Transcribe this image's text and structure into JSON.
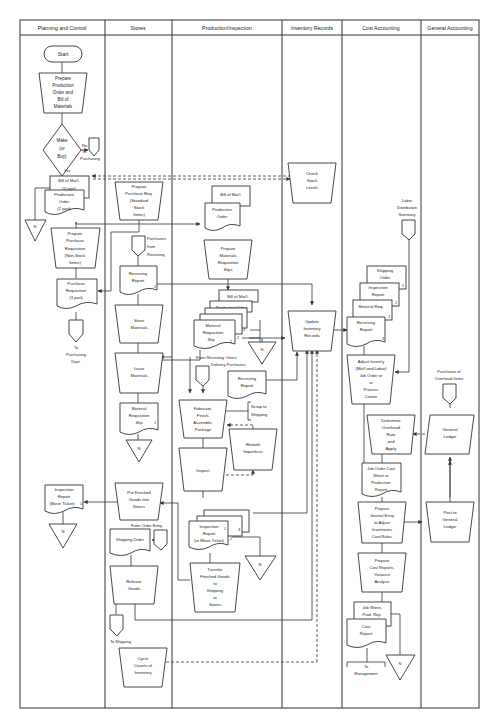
{
  "lanes": [
    {
      "label": "Planning and Control",
      "x1": 20,
      "x2": 105
    },
    {
      "label": "Stores",
      "x1": 105,
      "x2": 172
    },
    {
      "label": "Production/Inspection",
      "x1": 172,
      "x2": 282
    },
    {
      "label": "Inventory Records",
      "x1": 282,
      "x2": 342
    },
    {
      "label": "Cost Accounting",
      "x1": 342,
      "x2": 421
    },
    {
      "label": "General Accounting",
      "x1": 421,
      "x2": 479
    }
  ],
  "nodes": {
    "start": {
      "type": "terminal",
      "lines": [
        "Start"
      ]
    },
    "prepare_prod_order": {
      "type": "manual",
      "lines": [
        "Prepare",
        "Production",
        "Order and",
        "Bill of",
        "Materials"
      ]
    },
    "make_or_buy": {
      "type": "decision",
      "lines": [
        "Make",
        "(or",
        "Buy)"
      ]
    },
    "no_label": "No",
    "yes_label": "Yes",
    "to_purchasing_label": [
      "To",
      "Purchasing"
    ],
    "bom_2part": {
      "type": "document",
      "lines": [
        "Bill of Mat'l.",
        "(2 part)"
      ]
    },
    "prod_order_2part": {
      "type": "document",
      "lines": [
        "Production",
        "Order",
        "(2 part)"
      ]
    },
    "file_n": "N",
    "prepare_pr_nonstock": {
      "type": "manual",
      "lines": [
        "Prepare",
        "Purchase",
        "Requisition",
        "(Non-Stock",
        "Items)"
      ]
    },
    "purchase_req_3part": {
      "type": "document",
      "lines": [
        "Purchase",
        "Requisition",
        "(3 part)"
      ]
    },
    "to_purchasing_dept": [
      "To",
      "Purchasing",
      "Dept."
    ],
    "inspection_report_move": {
      "type": "document",
      "lines": [
        "Inspection",
        "Report",
        "(Move Ticket)"
      ],
      "copy": "1"
    },
    "prepare_pr_standard": {
      "type": "manual",
      "lines": [
        "Prepare",
        "Purchase Req.",
        "(Standard",
        "Stock",
        "Items)"
      ]
    },
    "purchases_from_receiving": [
      "Purchases",
      "from",
      "Receiving"
    ],
    "receiving_report_stores": {
      "type": "document",
      "lines": [
        "Receiving",
        "Report"
      ],
      "copy": "2"
    },
    "store_materials": {
      "type": "manual",
      "lines": [
        "Store",
        "Materials"
      ]
    },
    "issue_materials": {
      "type": "manual",
      "lines": [
        "Issue",
        "Materials"
      ]
    },
    "mat_req_slip_stores": {
      "type": "document",
      "lines": [
        "Material",
        "Requisition",
        "Slip"
      ],
      "copy": "1"
    },
    "put_finished_goods": {
      "type": "manual",
      "lines": [
        "Put Finished",
        "Goods into",
        "Stores"
      ]
    },
    "from_order_entry": "From Order Entry",
    "shipping_order_stores": {
      "type": "document",
      "lines": [
        "Shipping Order"
      ]
    },
    "release_goods": {
      "type": "manual",
      "lines": [
        "Release",
        "Goods"
      ]
    },
    "to_shipping": "To Shipping",
    "cycle_counts": {
      "type": "manual",
      "lines": [
        "Cycle",
        "Counts of",
        "Inventory"
      ]
    },
    "bom_prod": {
      "type": "document",
      "lines": [
        "Bill of Mat'l."
      ]
    },
    "prod_order_prod": {
      "type": "document",
      "lines": [
        "Production",
        "Order"
      ]
    },
    "prepare_mat_req_slips": {
      "type": "manual",
      "lines": [
        "Prepare",
        "Materials",
        "Requisition",
        "Slips"
      ]
    },
    "doc_stack_prod": {
      "lines": [
        "Bill of Mat'l.",
        "ProductionOrder",
        "Material",
        "Requisition",
        "Slip"
      ],
      "copies": [
        "3",
        "2",
        "1"
      ]
    },
    "from_receiving_direct": [
      "From Receiving:  Direct",
      "Delivery Purchases"
    ],
    "receiving_report_prod": {
      "type": "document",
      "lines": [
        "Receiving",
        "Report"
      ]
    },
    "scrap_to_shipping": [
      "Scrap to",
      "Shipping"
    ],
    "fabricate": {
      "type": "manual",
      "lines": [
        "Fabricate,",
        "Finish,",
        "Assemble,",
        "Package"
      ]
    },
    "rework": {
      "type": "manual",
      "lines": [
        "Rework",
        "Imperfects"
      ]
    },
    "inspect": {
      "type": "manual",
      "lines": [
        "Inspect"
      ]
    },
    "inspection_report_prod": {
      "type": "document",
      "lines": [
        "Inspection",
        "Report",
        "(or Move Ticket)"
      ],
      "copies": [
        "1",
        "2",
        "3"
      ]
    },
    "transfer_fg": {
      "type": "manual",
      "lines": [
        "Transfer",
        "Finished Goods",
        "to",
        "Shipping",
        "or",
        "Stores"
      ]
    },
    "check_stock": {
      "type": "manual",
      "lines": [
        "Check",
        "Stock",
        "Levels"
      ]
    },
    "update_inventory": {
      "type": "manual",
      "lines": [
        "Update",
        "Inventory",
        "Records"
      ]
    },
    "labor_distribution": [
      "Labor",
      "Distribution",
      "Summary"
    ],
    "cost_doc_stack": {
      "lines": [
        "Shipping",
        "Order",
        "Inspection",
        "Report",
        "Material Req.",
        "Receiving",
        "Report"
      ],
      "copies": [
        "5",
        "2",
        "2",
        "3"
      ]
    },
    "adjust_inventory": {
      "type": "manual",
      "lines": [
        "Adjust Invent'y",
        "(Mat'l and Labor)",
        "Job Order  or",
        "or",
        "Process",
        "Center"
      ]
    },
    "determine_overhead": {
      "type": "manual",
      "lines": [
        "Determine",
        "Overhead",
        "Rate",
        "and",
        "Apply"
      ]
    },
    "job_order_cost_sheet": {
      "type": "document",
      "lines": [
        "Job Order Cost",
        "Sheet or",
        "Production",
        "Report"
      ]
    },
    "prepare_journal_entry": {
      "type": "manual",
      "lines": [
        "Prepare",
        "Journal Entry",
        "to Adjust",
        "Inventories",
        "Cost/Sales"
      ]
    },
    "prepare_cost_reports": {
      "type": "manual",
      "lines": [
        "Prepare",
        "Cost Reports,",
        "Variance",
        "Analysis"
      ]
    },
    "job_sheet_prod_rep": {
      "type": "document",
      "lines": [
        "Job Sheet,",
        "Prod. Rep."
      ]
    },
    "cost_report": {
      "type": "document",
      "lines": [
        "Cost",
        "Report"
      ]
    },
    "to_management": [
      "To",
      "Management"
    ],
    "purchases_overhead": [
      "Purchases of",
      "Overhead Items"
    ],
    "general_ledger": {
      "type": "io",
      "lines": [
        "General",
        "Ledger"
      ]
    },
    "post_to_gl": {
      "type": "manual",
      "lines": [
        "Post to",
        "General",
        "Ledger"
      ]
    }
  },
  "colors": {
    "line": "#333333",
    "fill": "#ffffff",
    "text": "#222222"
  }
}
